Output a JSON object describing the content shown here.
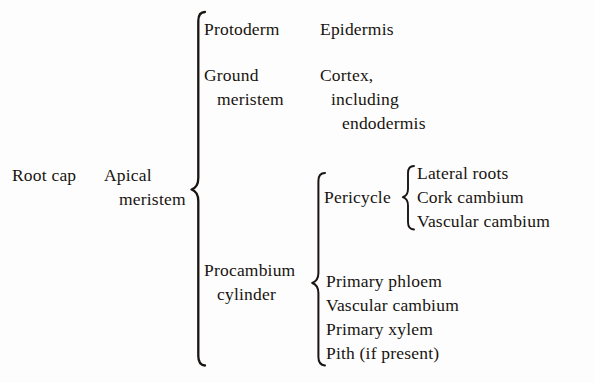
{
  "diagram": {
    "type": "brace-hierarchy",
    "background_color": "#fdfdfd",
    "text_color": "#181410",
    "root": {
      "labels": [
        {
          "id": "root-cap",
          "text": "Root cap"
        },
        {
          "id": "apical-meristem-line1",
          "text": "Apical"
        },
        {
          "id": "apical-meristem-line2",
          "text": "meristem"
        }
      ]
    },
    "primary_meristems": [
      {
        "id": "protoderm",
        "name_lines": [
          "Protoderm"
        ],
        "derivative_lines": [
          "Epidermis"
        ]
      },
      {
        "id": "ground-meristem",
        "name_lines": [
          "Ground",
          "meristem"
        ],
        "derivative_lines": [
          "Cortex,",
          "including",
          "endodermis"
        ]
      },
      {
        "id": "procambium-cylinder",
        "name_lines": [
          "Procambium",
          "cylinder"
        ],
        "derivative_lines": []
      }
    ],
    "procambium_derivatives": {
      "pericycle": {
        "id": "pericycle",
        "label": "Pericycle",
        "items": [
          "Lateral roots",
          "Cork cambium",
          "Vascular cambium"
        ]
      },
      "vascular_tissues": {
        "id": "vascular-tissues",
        "items": [
          "Primary phloem",
          "Vascular cambium",
          "Primary xylem",
          "Pith (if present)"
        ]
      }
    }
  }
}
